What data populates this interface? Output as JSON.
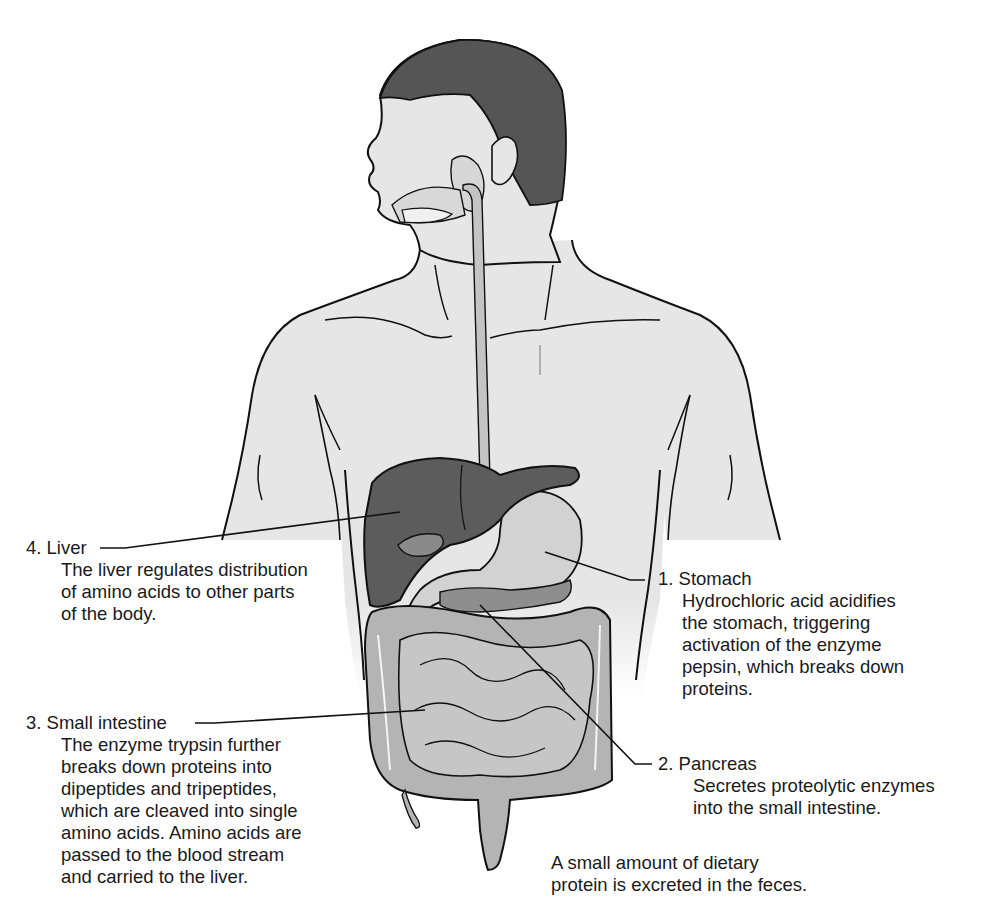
{
  "figure": {
    "colors": {
      "skin": "#e6e6e6",
      "hair": "#555555",
      "liver": "#5c5c5c",
      "liver_dark": "#4a4a4a",
      "stomach": "#d2d2d2",
      "intestine": "#b4b4b4",
      "esophagus": "#c4c4c4",
      "pancreas": "#8e8e8e",
      "outline": "#111111",
      "background": "#ffffff"
    }
  },
  "labels": [
    {
      "id": "stomach",
      "title": "1. Stomach",
      "lines": [
        "Hydrochloric acid acidifies",
        "the stomach, triggering",
        "activation of the enzyme",
        "pepsin, which breaks down",
        "proteins."
      ]
    },
    {
      "id": "pancreas",
      "title": "2. Pancreas",
      "lines": [
        "Secretes proteolytic enzymes",
        "into the small intestine."
      ]
    },
    {
      "id": "small_intestine",
      "title": "3. Small intestine",
      "lines": [
        "The enzyme trypsin further",
        "breaks down proteins into",
        "dipeptides and tripeptides,",
        "which are cleaved into single",
        "amino acids. Amino acids are",
        "passed to the blood stream",
        "and carried to the liver."
      ]
    },
    {
      "id": "liver",
      "title": "4. Liver",
      "lines": [
        "The liver regulates distribution",
        "of amino acids to other parts",
        "of the body."
      ]
    }
  ],
  "note": {
    "lines": [
      "A small amount of dietary",
      "protein is excreted in the feces."
    ]
  }
}
